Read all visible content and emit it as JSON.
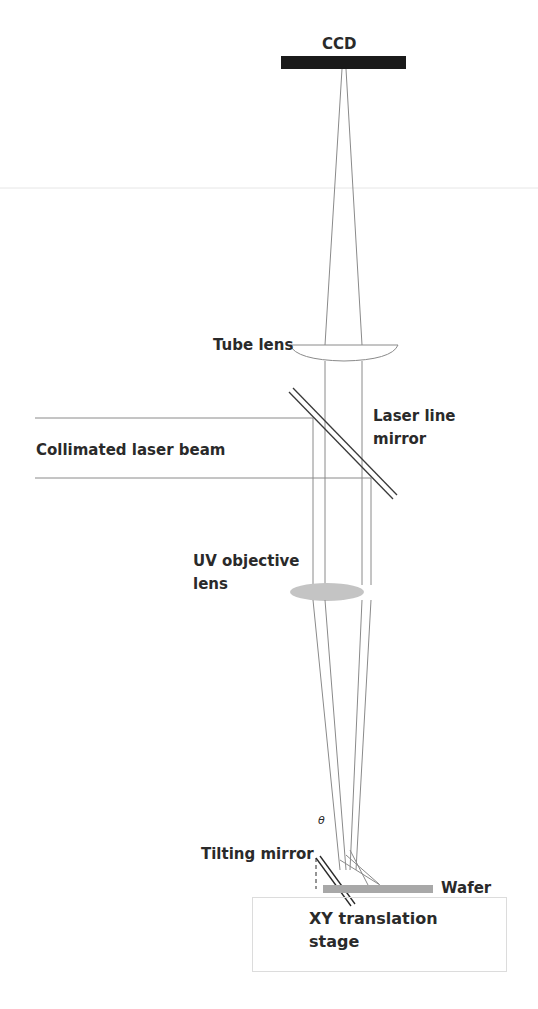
{
  "diagram": {
    "type": "optical-setup",
    "labels": {
      "ccd": "CCD",
      "tube_lens": "Tube lens",
      "laser_line_mirror_1": "Laser line",
      "laser_line_mirror_2": "mirror",
      "collimated_beam": "Collimated laser beam",
      "objective_1": "UV objective",
      "objective_2": "lens",
      "theta": "θ",
      "tilting_mirror": "Tilting mirror",
      "wafer": "Wafer",
      "stage_1": "XY translation",
      "stage_2": "stage"
    },
    "colors": {
      "ccd": "#1a1a1a",
      "beam": "#8a8a8a",
      "objective_lens": "#c4c4c4",
      "wafer": "#a8a8a8",
      "text": "#2a2a2a"
    }
  }
}
